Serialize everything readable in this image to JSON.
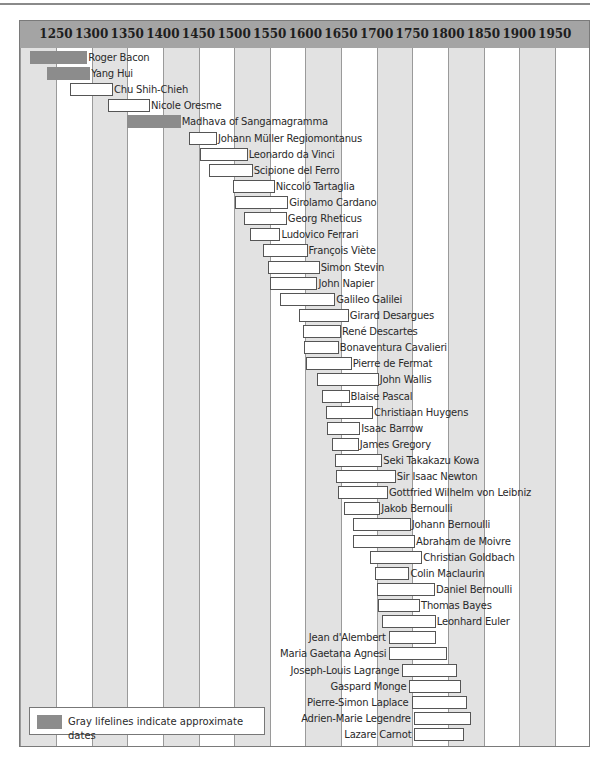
{
  "chart_data": {
    "type": "timeline",
    "title": "",
    "axis": {
      "ticks": [
        1250,
        1300,
        1350,
        1400,
        1450,
        1500,
        1550,
        1600,
        1650,
        1700,
        1750,
        1800,
        1850,
        1900,
        1950
      ],
      "range": [
        1200,
        2000
      ],
      "position": "top",
      "alternating_stripes": true
    },
    "legend": {
      "position": "bottom-left",
      "entries": [
        {
          "swatch": "gray",
          "label": "Gray lifelines indicate approximate dates"
        }
      ]
    },
    "colors": {
      "header": "#a4a4a4",
      "stripe": "#e2e2e2",
      "approx": "#8c8c8c",
      "exact_fill": "#ffffff",
      "exact_border": "#555555"
    },
    "lifelines": [
      {
        "name": "Roger Bacon",
        "start": 1214,
        "end": 1294,
        "approx": true,
        "label_side": "right"
      },
      {
        "name": "Yang Hui",
        "start": 1238,
        "end": 1298,
        "approx": true,
        "label_side": "right"
      },
      {
        "name": "Chu Shih-Chieh",
        "start": 1270,
        "end": 1330,
        "approx": false,
        "label_side": "right"
      },
      {
        "name": "Nicole Oresme",
        "start": 1323,
        "end": 1382,
        "approx": false,
        "label_side": "right"
      },
      {
        "name": "Madhava of Sangamagramma",
        "start": 1350,
        "end": 1425,
        "approx": true,
        "label_side": "right"
      },
      {
        "name": "Johann Müller Regiomontanus",
        "start": 1436,
        "end": 1476,
        "approx": false,
        "label_side": "right"
      },
      {
        "name": "Leonardo da Vinci",
        "start": 1452,
        "end": 1519,
        "approx": false,
        "label_side": "right"
      },
      {
        "name": "Scipione del Ferro",
        "start": 1465,
        "end": 1526,
        "approx": false,
        "label_side": "right"
      },
      {
        "name": "Niccoló Tartaglia",
        "start": 1499,
        "end": 1557,
        "approx": false,
        "label_side": "right"
      },
      {
        "name": "Girolamo Cardano",
        "start": 1501,
        "end": 1576,
        "approx": false,
        "label_side": "right"
      },
      {
        "name": "Georg Rheticus",
        "start": 1514,
        "end": 1574,
        "approx": false,
        "label_side": "right"
      },
      {
        "name": "Ludovico Ferrari",
        "start": 1522,
        "end": 1565,
        "approx": false,
        "label_side": "right"
      },
      {
        "name": "François Viète",
        "start": 1540,
        "end": 1603,
        "approx": false,
        "label_side": "right"
      },
      {
        "name": "Simon Stevin",
        "start": 1548,
        "end": 1620,
        "approx": false,
        "label_side": "right"
      },
      {
        "name": "John Napier",
        "start": 1550,
        "end": 1617,
        "approx": false,
        "label_side": "right"
      },
      {
        "name": "Galileo Galilei",
        "start": 1564,
        "end": 1642,
        "approx": false,
        "label_side": "right"
      },
      {
        "name": "Girard Desargues",
        "start": 1591,
        "end": 1661,
        "approx": false,
        "label_side": "right"
      },
      {
        "name": "René Descartes",
        "start": 1596,
        "end": 1650,
        "approx": false,
        "label_side": "right"
      },
      {
        "name": "Bonaventura Cavalieri",
        "start": 1598,
        "end": 1647,
        "approx": false,
        "label_side": "right"
      },
      {
        "name": "Pierre de Fermat",
        "start": 1601,
        "end": 1665,
        "approx": false,
        "label_side": "right"
      },
      {
        "name": "John Wallis",
        "start": 1616,
        "end": 1703,
        "approx": false,
        "label_side": "right"
      },
      {
        "name": "Blaise Pascal",
        "start": 1623,
        "end": 1662,
        "approx": false,
        "label_side": "right"
      },
      {
        "name": "Christiaan Huygens",
        "start": 1629,
        "end": 1695,
        "approx": false,
        "label_side": "right"
      },
      {
        "name": "Isaac Barrow",
        "start": 1630,
        "end": 1677,
        "approx": false,
        "label_side": "right"
      },
      {
        "name": "James Gregory",
        "start": 1638,
        "end": 1675,
        "approx": false,
        "label_side": "right"
      },
      {
        "name": "Seki Takakazu Kowa",
        "start": 1642,
        "end": 1708,
        "approx": false,
        "label_side": "right"
      },
      {
        "name": "Sir Isaac Newton",
        "start": 1643,
        "end": 1727,
        "approx": false,
        "label_side": "right"
      },
      {
        "name": "Gottfried Wilhelm von Leibniz",
        "start": 1646,
        "end": 1716,
        "approx": false,
        "label_side": "right"
      },
      {
        "name": "Jakob Bernoulli",
        "start": 1654,
        "end": 1705,
        "approx": false,
        "label_side": "right"
      },
      {
        "name": "Johann Bernoulli",
        "start": 1667,
        "end": 1748,
        "approx": false,
        "label_side": "right"
      },
      {
        "name": "Abraham de Moivre",
        "start": 1667,
        "end": 1754,
        "approx": false,
        "label_side": "right"
      },
      {
        "name": "Christian Goldbach",
        "start": 1690,
        "end": 1764,
        "approx": false,
        "label_side": "right"
      },
      {
        "name": "Colin Maclaurin",
        "start": 1698,
        "end": 1746,
        "approx": false,
        "label_side": "right"
      },
      {
        "name": "Daniel Bernoulli",
        "start": 1700,
        "end": 1782,
        "approx": false,
        "label_side": "right"
      },
      {
        "name": "Thomas Bayes",
        "start": 1702,
        "end": 1761,
        "approx": false,
        "label_side": "right"
      },
      {
        "name": "Leonhard Euler",
        "start": 1707,
        "end": 1783,
        "approx": false,
        "label_side": "right"
      },
      {
        "name": "Jean d'Alembert",
        "start": 1717,
        "end": 1783,
        "approx": false,
        "label_side": "left"
      },
      {
        "name": "Maria Gaetana Agnesi",
        "start": 1718,
        "end": 1799,
        "approx": false,
        "label_side": "left"
      },
      {
        "name": "Joseph-Louis Lagrange",
        "start": 1736,
        "end": 1813,
        "approx": false,
        "label_side": "left"
      },
      {
        "name": "Gaspard Monge",
        "start": 1746,
        "end": 1818,
        "approx": false,
        "label_side": "left"
      },
      {
        "name": "Pierre-Simon Laplace",
        "start": 1749,
        "end": 1827,
        "approx": false,
        "label_side": "left"
      },
      {
        "name": "Adrien-Marie Legendre",
        "start": 1752,
        "end": 1833,
        "approx": false,
        "label_side": "left"
      },
      {
        "name": "Lazare Carnot",
        "start": 1753,
        "end": 1823,
        "approx": false,
        "label_side": "left"
      }
    ]
  }
}
